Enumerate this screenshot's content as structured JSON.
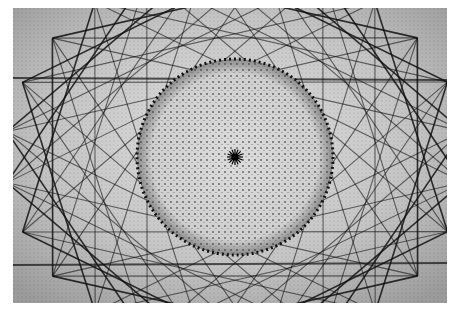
{
  "image": {
    "description": "Grayscale photograph of geometric string art: a dense dotted sphere/circle at center surrounded by overlapping straight line star polygons",
    "background": "#ffffff",
    "tone": "#d8d8d8",
    "ink": "#111111",
    "circle": {
      "cx": 222,
      "cy": 149,
      "r": 98
    },
    "star_points": 24,
    "star_radius": 230,
    "center_rays": 16
  }
}
